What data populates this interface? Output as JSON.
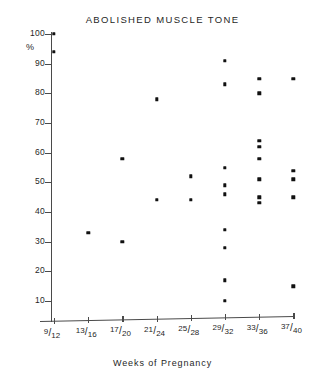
{
  "chart_data": {
    "type": "scatter",
    "title": "ABOLISHED MUSCLE TONE",
    "xlabel": "Weeks of Pregnancy",
    "ylabel": "%",
    "categories": [
      "9/12",
      "13/16",
      "17/20",
      "21/24",
      "25/28",
      "29/32",
      "33/36",
      "37/40"
    ],
    "category_numerators": [
      "9",
      "13",
      "17",
      "21",
      "25",
      "29",
      "33",
      "37"
    ],
    "category_denominators": [
      "12",
      "16",
      "20",
      "24",
      "28",
      "32",
      "36",
      "40"
    ],
    "ylim": [
      5,
      102
    ],
    "yticks": [
      10,
      20,
      30,
      40,
      50,
      60,
      70,
      80,
      90,
      100
    ],
    "ytick_labels": [
      "10",
      "20",
      "30",
      "40",
      "50",
      "60",
      "70",
      "80",
      "90",
      "100"
    ],
    "grid": false,
    "legend": false,
    "points": [
      {
        "category": "9/12",
        "x_index": 0,
        "y": 100
      },
      {
        "category": "9/12",
        "x_index": 0,
        "y": 94
      },
      {
        "category": "13/16",
        "x_index": 1,
        "y": 33
      },
      {
        "category": "17/20",
        "x_index": 2,
        "y": 58
      },
      {
        "category": "17/20",
        "x_index": 2,
        "y": 30
      },
      {
        "category": "21/24",
        "x_index": 3,
        "y": 78
      },
      {
        "category": "21/24",
        "x_index": 3,
        "y": 44
      },
      {
        "category": "25/28",
        "x_index": 4,
        "y": 52
      },
      {
        "category": "25/28",
        "x_index": 4,
        "y": 44
      },
      {
        "category": "29/32",
        "x_index": 5,
        "y": 91
      },
      {
        "category": "29/32",
        "x_index": 5,
        "y": 83
      },
      {
        "category": "29/32",
        "x_index": 5,
        "y": 55
      },
      {
        "category": "29/32",
        "x_index": 5,
        "y": 49
      },
      {
        "category": "29/32",
        "x_index": 5,
        "y": 46
      },
      {
        "category": "29/32",
        "x_index": 5,
        "y": 34
      },
      {
        "category": "29/32",
        "x_index": 5,
        "y": 28
      },
      {
        "category": "29/32",
        "x_index": 5,
        "y": 17
      },
      {
        "category": "29/32",
        "x_index": 5,
        "y": 10
      },
      {
        "category": "33/36",
        "x_index": 6,
        "y": 85
      },
      {
        "category": "33/36",
        "x_index": 6,
        "y": 80
      },
      {
        "category": "33/36",
        "x_index": 6,
        "y": 64
      },
      {
        "category": "33/36",
        "x_index": 6,
        "y": 62
      },
      {
        "category": "33/36",
        "x_index": 6,
        "y": 58
      },
      {
        "category": "33/36",
        "x_index": 6,
        "y": 51
      },
      {
        "category": "33/36",
        "x_index": 6,
        "y": 45
      },
      {
        "category": "33/36",
        "x_index": 6,
        "y": 43
      },
      {
        "category": "37/40",
        "x_index": 7,
        "y": 85
      },
      {
        "category": "37/40",
        "x_index": 7,
        "y": 54
      },
      {
        "category": "37/40",
        "x_index": 7,
        "y": 51
      },
      {
        "category": "37/40",
        "x_index": 7,
        "y": 45
      },
      {
        "category": "37/40",
        "x_index": 7,
        "y": 15
      }
    ]
  },
  "colors": {
    "background": "#ffffff",
    "axis": "#4a4a4a",
    "marker": "#111111",
    "text": "#1f1f1f"
  }
}
